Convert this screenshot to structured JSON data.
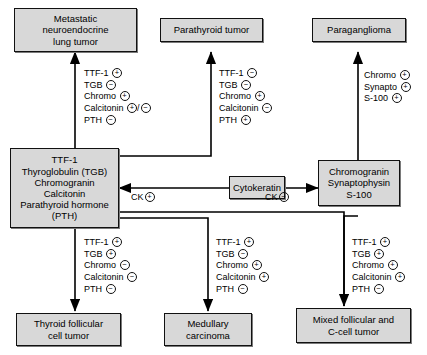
{
  "diagram": {
    "sign_positive": "+",
    "sign_negative": "−",
    "nodes": {
      "metastatic": {
        "id": "metastatic-lung-tumor",
        "lines": [
          "Metastatic",
          "neuroendocrine",
          "lung tumor"
        ]
      },
      "parathyroid": {
        "id": "parathyroid-tumor",
        "lines": [
          "Parathyroid tumor"
        ]
      },
      "paraganglioma": {
        "id": "paraganglioma",
        "lines": [
          "Paraganglioma"
        ]
      },
      "source_left": {
        "id": "ttf1-thyroglobulin-panel",
        "lines": [
          "TTF-1",
          "Thyroglobulin (TGB)",
          "Chromogranin",
          "Calcitonin",
          "Parathyroid hormone",
          "(PTH)"
        ]
      },
      "source_right": {
        "id": "chromogranin-synaptophysin-panel",
        "lines": [
          "Chromogranin",
          "Synaptophysin",
          "S-100"
        ]
      },
      "cytokeratin": {
        "id": "cytokeratin",
        "lines": [
          "Cytokeratin"
        ]
      },
      "thyroid_follicular": {
        "id": "thyroid-follicular-cell-tumor",
        "lines": [
          "Thyroid follicular",
          "cell tumor"
        ]
      },
      "medullary": {
        "id": "medullary-carcinoma",
        "lines": [
          "Medullary",
          "carcinoma"
        ]
      },
      "mixed": {
        "id": "mixed-follicular-c-cell-tumor",
        "lines": [
          "Mixed follicular and",
          "C-cell tumor"
        ]
      }
    },
    "edge_labels": {
      "ck_positive": {
        "text": "CK",
        "sign": "+"
      },
      "ck_negative": {
        "text": "CK",
        "sign": "−"
      }
    },
    "panels": {
      "to_metastatic": [
        {
          "marker": "TTF-1",
          "sign": "+"
        },
        {
          "marker": "TGB",
          "sign": "−"
        },
        {
          "marker": "Chromo",
          "sign": "+"
        },
        {
          "marker": "Calcitonin",
          "sign": "+/−"
        },
        {
          "marker": "PTH",
          "sign": "−"
        }
      ],
      "to_parathyroid": [
        {
          "marker": "TTF-1",
          "sign": "−"
        },
        {
          "marker": "TGB",
          "sign": "−"
        },
        {
          "marker": "Chromo",
          "sign": "+"
        },
        {
          "marker": "Calcitonin",
          "sign": "−"
        },
        {
          "marker": "PTH",
          "sign": "+"
        }
      ],
      "to_paraganglioma": [
        {
          "marker": "Chromo",
          "sign": "+"
        },
        {
          "marker": "Synapto",
          "sign": "+"
        },
        {
          "marker": "S-100",
          "sign": "+"
        }
      ],
      "to_thyroid_follicular": [
        {
          "marker": "TTF-1",
          "sign": "+"
        },
        {
          "marker": "TGB",
          "sign": "+"
        },
        {
          "marker": "Chromo",
          "sign": "−"
        },
        {
          "marker": "Calcitonin",
          "sign": "−"
        },
        {
          "marker": "PTH",
          "sign": "−"
        }
      ],
      "to_medullary": [
        {
          "marker": "TTF-1",
          "sign": "+"
        },
        {
          "marker": "TGB",
          "sign": "−"
        },
        {
          "marker": "Chromo",
          "sign": "+"
        },
        {
          "marker": "Calcitonin",
          "sign": "+"
        },
        {
          "marker": "PTH",
          "sign": "−"
        }
      ],
      "to_mixed": [
        {
          "marker": "TTF-1",
          "sign": "+"
        },
        {
          "marker": "TGB",
          "sign": "+"
        },
        {
          "marker": "Chromo",
          "sign": "+"
        },
        {
          "marker": "Calcitonin",
          "sign": "+"
        },
        {
          "marker": "PTH",
          "sign": "−"
        }
      ]
    },
    "colors": {
      "node_fill": "#d8d8d8",
      "node_border": "#111111",
      "line": "#000000"
    }
  }
}
